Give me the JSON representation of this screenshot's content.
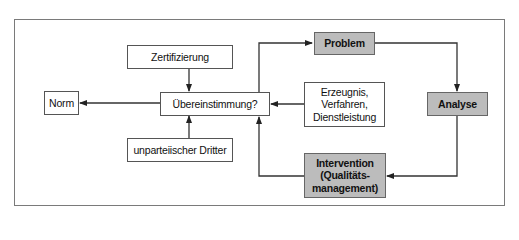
{
  "diagram": {
    "type": "flowchart",
    "colors": {
      "highlight_fill": "#bcbcbc",
      "line": "#333333",
      "frame": "#7a7a7a"
    },
    "nodes": {
      "norm": {
        "label": "Norm"
      },
      "zertifizierung": {
        "label": "Zertifizierung"
      },
      "uebereinstimmung": {
        "label": "Übereinstimmung?"
      },
      "dritter": {
        "label": "unparteiischer Dritter"
      },
      "erzeugnis": {
        "label": "Erzeugnis,\nVerfahren,\nDienstleistung"
      },
      "problem": {
        "label": "Problem"
      },
      "analyse": {
        "label": "Analyse"
      },
      "intervention": {
        "label": "Intervention\n(Qualitäts-\nmanagement)"
      }
    },
    "edges": [
      {
        "from": "uebereinstimmung",
        "to": "norm"
      },
      {
        "from": "zertifizierung",
        "to": "uebereinstimmung"
      },
      {
        "from": "dritter",
        "to": "uebereinstimmung"
      },
      {
        "from": "erzeugnis",
        "to": "uebereinstimmung"
      },
      {
        "from": "uebereinstimmung",
        "to": "problem"
      },
      {
        "from": "problem",
        "to": "analyse"
      },
      {
        "from": "analyse",
        "to": "intervention"
      },
      {
        "from": "intervention",
        "to": "uebereinstimmung"
      }
    ]
  }
}
